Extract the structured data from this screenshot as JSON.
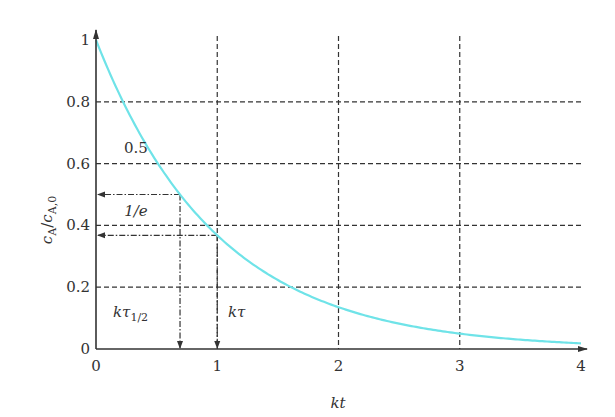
{
  "chart_data": {
    "type": "line",
    "title": "",
    "xlabel": "kt",
    "ylabel": "c_A / c_A,0",
    "xlim": [
      0,
      4
    ],
    "ylim": [
      0,
      1
    ],
    "xticks": [
      "0",
      "1",
      "2",
      "3",
      "4"
    ],
    "yticks": [
      "0",
      "0.2",
      "0.4",
      "0.6",
      "0.8",
      "1"
    ],
    "grid": "dashed",
    "series": [
      {
        "name": "c_A/c_A,0 = exp(-kt)",
        "color": "#6fe3e8",
        "x": [
          0,
          0.25,
          0.5,
          0.693,
          1,
          1.5,
          2,
          2.5,
          3,
          3.5,
          4
        ],
        "y": [
          1,
          0.779,
          0.607,
          0.5,
          0.368,
          0.223,
          0.135,
          0.082,
          0.05,
          0.03,
          0.018
        ]
      }
    ],
    "annotations": [
      {
        "label": "0.5",
        "y": 0.5,
        "x": 0.693,
        "marker": "kτ_1/2"
      },
      {
        "label": "1/e",
        "y": 0.368,
        "x": 1.0,
        "marker": "kτ"
      }
    ]
  },
  "labels": {
    "ylabel_main": "c",
    "ylabel_sub1": "A",
    "ylabel_slash": "/",
    "ylabel_sub2": "A,0",
    "xlabel": "kt",
    "ann_half": "0.5",
    "ann_inv_e": "1/e",
    "ktau_half_main": "kτ",
    "ktau_half_sub": "1/2",
    "ktau": "kτ"
  }
}
